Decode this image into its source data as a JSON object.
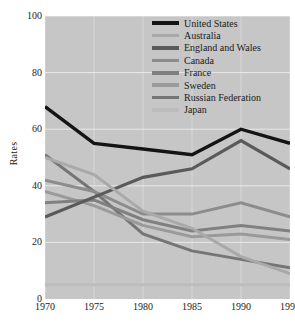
{
  "chart_data": {
    "type": "line",
    "title": "",
    "xlabel": "",
    "ylabel": "Rates",
    "x": [
      1970,
      1975,
      1980,
      1985,
      1990,
      1995
    ],
    "xtick_labels": [
      "1970",
      "1975",
      "1980",
      "1985",
      "1990",
      "1995"
    ],
    "ytick_labels": [
      "0",
      "20",
      "40",
      "60",
      "80",
      "100"
    ],
    "ylim": [
      0,
      100
    ],
    "xlim": [
      1970,
      1995
    ],
    "grid": true,
    "grid_color": "#e8e8e8",
    "plot_background": "#c6c6c6",
    "legend_position": "top-right-inside",
    "series": [
      {
        "name": "United States",
        "color": "#141414",
        "width": 3.4,
        "values": [
          68,
          55,
          53,
          51,
          60,
          55
        ]
      },
      {
        "name": "Australia",
        "color": "#a9a9a9",
        "width": 3.0,
        "values": [
          50,
          44,
          31,
          25,
          15,
          9
        ]
      },
      {
        "name": "England and Wales",
        "color": "#5a5a5a",
        "width": 3.2,
        "values": [
          29,
          36,
          43,
          46,
          56,
          46
        ]
      },
      {
        "name": "Canada",
        "color": "#8c8c8c",
        "width": 3.0,
        "values": [
          42,
          38,
          30,
          30,
          34,
          29
        ]
      },
      {
        "name": "France",
        "color": "#808080",
        "width": 3.0,
        "values": [
          34,
          35,
          28,
          24,
          26,
          24
        ]
      },
      {
        "name": "Sweden",
        "color": "#9a9a9a",
        "width": 3.0,
        "values": [
          38,
          33,
          26,
          22,
          23,
          21
        ]
      },
      {
        "name": "Russian Federation",
        "color": "#757575",
        "width": 3.0,
        "values": [
          51,
          38,
          23,
          17,
          14,
          11
        ]
      },
      {
        "name": "Japan",
        "color": "#bdbdbd",
        "width": 3.0,
        "values": [
          5,
          5,
          5,
          5,
          5,
          5
        ]
      }
    ]
  },
  "caption_clipped": "      "
}
